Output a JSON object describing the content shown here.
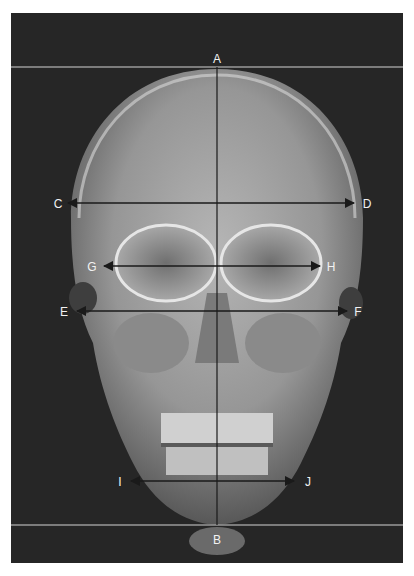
{
  "figure": {
    "background_color": "#262626",
    "reference_line_color": "#9a9a9a",
    "measure_line_color": "#1a1a1a",
    "label_color": "#f2f2f2"
  },
  "labels": {
    "A": "A",
    "B": "B",
    "C": "C",
    "D": "D",
    "E": "E",
    "F": "F",
    "G": "G",
    "H": "H",
    "I": "I",
    "J": "J"
  },
  "lines": [
    {
      "name": "A-B",
      "type": "vertical midline",
      "from": "A",
      "to": "B"
    },
    {
      "name": "C-D",
      "type": "double-arrow",
      "from": "C",
      "to": "D"
    },
    {
      "name": "G-H",
      "type": "double-arrow",
      "from": "G",
      "to": "H"
    },
    {
      "name": "E-F",
      "type": "double-arrow",
      "from": "E",
      "to": "F"
    },
    {
      "name": "I-J",
      "type": "double-arrow",
      "from": "I",
      "to": "J"
    },
    {
      "name": "top-reference",
      "type": "horizontal reference line through A"
    },
    {
      "name": "bottom-reference",
      "type": "horizontal reference line through B"
    }
  ]
}
